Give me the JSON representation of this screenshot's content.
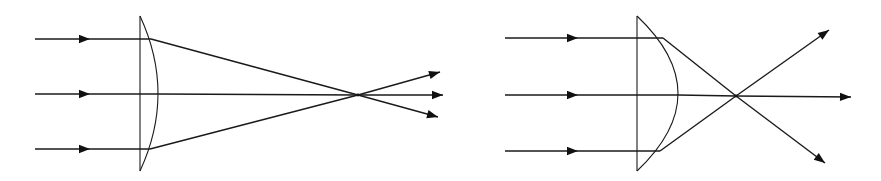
{
  "figure": {
    "colors": {
      "background": "#ffffff",
      "line": "#1a1a1a",
      "arrowhead": "#111111"
    }
  },
  "left_diagram": {
    "name": "thin-plano-convex-lens",
    "lens": {
      "flat_x": 140,
      "top_y": 16,
      "bottom_y": 171,
      "bulge_x": 158
    },
    "incident_rays": [
      {
        "y": 39,
        "start_x": 35,
        "arrow_x": 90,
        "hit_x": 151
      },
      {
        "y": 94,
        "start_x": 35,
        "arrow_x": 90,
        "hit_x": 158
      },
      {
        "y": 149,
        "start_x": 35,
        "arrow_x": 90,
        "hit_x": 150
      }
    ],
    "focal_point": {
      "x": 358,
      "y": 95
    },
    "outgoing_rays": [
      {
        "end_x": 440,
        "end_y": 72
      },
      {
        "end_x": 443,
        "end_y": 95
      },
      {
        "end_x": 438,
        "end_y": 117
      }
    ]
  },
  "right_diagram": {
    "name": "thick-plano-convex-lens",
    "lens": {
      "flat_x": 637,
      "top_y": 16,
      "bottom_y": 171,
      "bulge_x": 678
    },
    "incident_rays": [
      {
        "y": 38,
        "start_x": 505,
        "arrow_x": 578,
        "hit_x": 663
      },
      {
        "y": 95,
        "start_x": 505,
        "arrow_x": 578,
        "hit_x": 678
      },
      {
        "y": 151,
        "start_x": 505,
        "arrow_x": 578,
        "hit_x": 660
      }
    ],
    "focal_point": {
      "x": 736,
      "y": 96
    },
    "outgoing_rays": [
      {
        "end_x": 829,
        "end_y": 30
      },
      {
        "end_x": 851,
        "end_y": 97
      },
      {
        "end_x": 825,
        "end_y": 163
      }
    ]
  }
}
